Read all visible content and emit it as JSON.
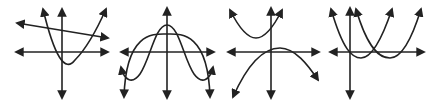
{
  "figure": {
    "description": "Four coordinate-plane graphs, each showing two curves",
    "stroke_color": "#222222",
    "background": "#ffffff",
    "graphs": [
      {
        "id": "graph-1",
        "label": "Graph 1: a line with negative slope and an upward-opening parabola",
        "curves": [
          "line with negative slope",
          "upward-opening parabola passing through origin, vertex right of y-axis below x-axis"
        ]
      },
      {
        "id": "graph-2",
        "label": "Graph 2: a downward-opening parabola and a quartic-like curve",
        "curves": [
          "downward-opening parabola, vertex on positive y-axis",
          "W-shaped-inverted quartic curve, peak on y-axis, arms turning up at ends"
        ]
      },
      {
        "id": "graph-3",
        "label": "Graph 3: an upward-opening parabola above x-axis and a downward-opening parabola",
        "curves": [
          "upward-opening parabola with vertex left of y-axis, above x-axis",
          "downward-opening parabola with vertex right of y-axis, slightly above x-axis"
        ]
      },
      {
        "id": "graph-4",
        "label": "Graph 4: two upward-opening parabolas, horizontally shifted",
        "curves": [
          "upward-opening parabola with vertex just right of y-axis, slightly below x-axis",
          "upward-opening parabola with vertex further right, slightly below x-axis"
        ]
      }
    ]
  }
}
